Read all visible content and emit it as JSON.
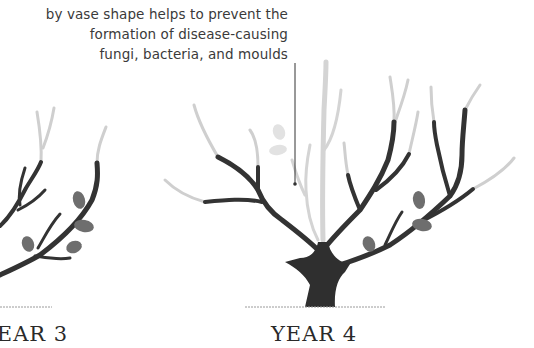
{
  "annotation": {
    "lines": [
      "by vase shape helps to prevent the",
      "formation of disease-causing",
      "fungi, bacteria, and moulds"
    ]
  },
  "panels": [
    {
      "label": "YEAR 3",
      "visible_label": "R 3"
    },
    {
      "label": "YEAR 4"
    }
  ],
  "colors": {
    "branch": "#333333",
    "pruned_tip": "#cfcfcf",
    "leaf": "#6e6e6e",
    "faded_leaf": "#e0e0e0",
    "ground": "#9a9a9a",
    "text": "#3a3a3a"
  }
}
